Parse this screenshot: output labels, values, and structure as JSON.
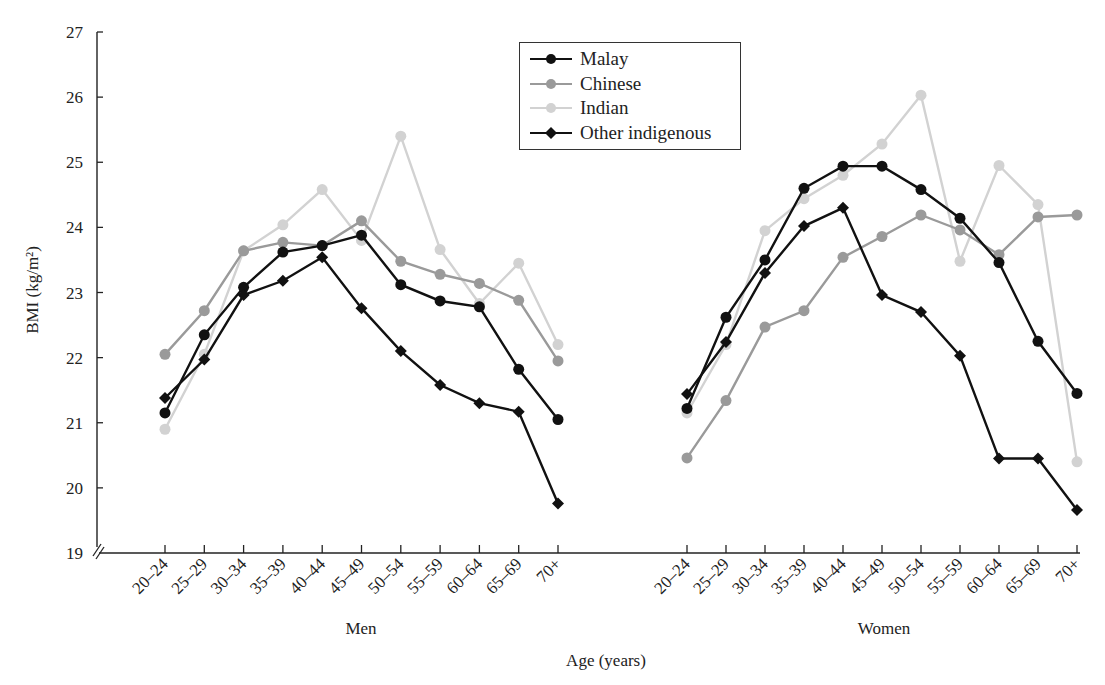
{
  "chart_data": {
    "type": "line",
    "title": "",
    "xlabel": "Age (years)",
    "ylabel": "BMI (kg/m²)",
    "ylim": [
      19,
      27
    ],
    "yticks": [
      19,
      20,
      21,
      22,
      23,
      24,
      25,
      26,
      27
    ],
    "grid": false,
    "legend_position": "top-center",
    "panels": [
      "Men",
      "Women"
    ],
    "categories": [
      "20–24",
      "25–29",
      "30–34",
      "35–39",
      "40–44",
      "45–49",
      "50–54",
      "55–59",
      "60–64",
      "65–69",
      "70+"
    ],
    "series": [
      {
        "name": "Malay",
        "marker": "circle",
        "color": "#111111",
        "men": [
          21.15,
          22.35,
          23.08,
          23.62,
          23.72,
          23.88,
          23.12,
          22.87,
          22.78,
          21.82,
          21.05
        ],
        "women": [
          21.22,
          22.62,
          23.5,
          24.6,
          24.94,
          24.94,
          24.58,
          24.14,
          23.46,
          22.25,
          21.45
        ]
      },
      {
        "name": "Chinese",
        "marker": "circle",
        "color": "#9a9a9a",
        "men": [
          22.05,
          22.72,
          23.64,
          23.77,
          23.72,
          24.1,
          23.48,
          23.28,
          23.14,
          22.88,
          21.95
        ],
        "women": [
          20.46,
          21.34,
          22.47,
          22.72,
          23.54,
          23.86,
          24.19,
          23.96,
          23.58,
          24.16,
          24.19
        ]
      },
      {
        "name": "Indian",
        "marker": "circle",
        "color": "#d2d2d2",
        "men": [
          20.9,
          22.05,
          23.64,
          24.04,
          24.58,
          23.8,
          25.4,
          23.66,
          22.83,
          23.45,
          22.2
        ],
        "women": [
          21.15,
          22.2,
          23.95,
          24.44,
          24.8,
          25.28,
          26.03,
          23.48,
          24.95,
          24.35,
          20.4
        ]
      },
      {
        "name": "Other indigenous",
        "marker": "diamond",
        "color": "#111111",
        "men": [
          21.38,
          21.97,
          22.96,
          23.18,
          23.54,
          22.76,
          22.1,
          21.58,
          21.3,
          21.17,
          19.76
        ],
        "women": [
          21.44,
          22.24,
          23.3,
          24.02,
          24.3,
          22.96,
          22.7,
          22.03,
          20.45,
          20.45,
          19.66
        ]
      }
    ]
  },
  "axis": {
    "y_title": "BMI (kg/m²)",
    "x_title": "Age (years)",
    "men_label": "Men",
    "women_label": "Women"
  },
  "legend": {
    "items": [
      "Malay",
      "Chinese",
      "Indian",
      "Other indigenous"
    ]
  }
}
